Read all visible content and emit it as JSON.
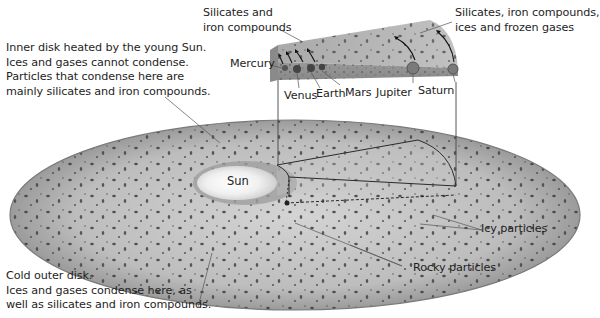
{
  "diagram": {
    "title": "",
    "center_label": "Sun",
    "annotations": {
      "inner_disk": [
        "Inner disk heated by the young Sun.",
        "Ices and gases cannot condense.",
        "Particles that condense here are",
        "mainly silicates and iron compounds."
      ],
      "outer_disk": [
        "Cold outer disk.",
        "Ices and gases condense here, as",
        "well as silicates and iron compounds."
      ],
      "inner_wedge_material": [
        "Silicates and",
        "iron compounds"
      ],
      "outer_wedge_material": [
        "Silicates, iron compounds,",
        "ices and frozen gases"
      ],
      "icy_particles": "Icy particles",
      "rocky_particles": "Rocky particles"
    },
    "planets": [
      {
        "name": "Mercury",
        "position": "innermost"
      },
      {
        "name": "Venus"
      },
      {
        "name": "Earth"
      },
      {
        "name": "Mars"
      },
      {
        "name": "Jupiter"
      },
      {
        "name": "Saturn",
        "position": "outermost"
      }
    ],
    "colors": {
      "disk_fill": "#b8b8b8",
      "disk_edge": "#6e6e6e",
      "particle": "#3a3a3a",
      "sun_glow": "#f4f4f4",
      "leader_line": "#555555"
    }
  }
}
